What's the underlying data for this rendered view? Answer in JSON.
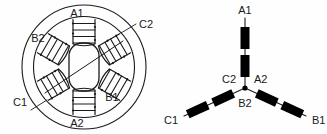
{
  "figure": {
    "background_color": "#fefefe",
    "line_color": "#1a1a1a",
    "coil_fill_color": "#000000"
  },
  "panels": [
    {
      "id": "motor-cross-section",
      "name": "stator-rotor-cross-section",
      "pole_count": 6,
      "labels": [
        {
          "text": "A1",
          "position": "top"
        },
        {
          "text": "C2",
          "position": "upper-right-outside"
        },
        {
          "text": "B1",
          "position": "lower-right-inside"
        },
        {
          "text": "A2",
          "position": "bottom"
        },
        {
          "text": "C1",
          "position": "lower-left-outside"
        },
        {
          "text": "B2",
          "position": "upper-left-inside"
        }
      ]
    },
    {
      "id": "wye-winding-schematic",
      "name": "three-phase-wye-connection",
      "coils_per_branch": 2,
      "branches": [
        {
          "terminal": "A1",
          "junction_label": "A2",
          "direction": "up"
        },
        {
          "terminal": "B1",
          "junction_label": "B2",
          "direction": "down-right"
        },
        {
          "terminal": "C1",
          "junction_label": "C2",
          "direction": "down-left"
        }
      ],
      "labels": [
        {
          "text": "A1"
        },
        {
          "text": "C2"
        },
        {
          "text": "A2"
        },
        {
          "text": "B2"
        },
        {
          "text": "C1"
        },
        {
          "text": "B1"
        }
      ]
    }
  ]
}
